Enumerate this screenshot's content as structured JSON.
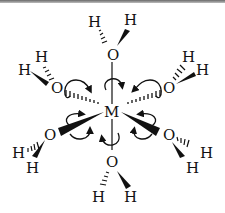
{
  "diagram": {
    "center": {
      "label": "M",
      "x": 112,
      "y": 112
    },
    "ligands": [
      {
        "id": "top",
        "O": "O",
        "H1": "H",
        "H2": "H",
        "ox": 113,
        "oy": 56
      },
      {
        "id": "upper-left",
        "O": "O",
        "H1": "H",
        "H2": "H",
        "ox": 57,
        "oy": 88
      },
      {
        "id": "upper-right",
        "O": "O",
        "H1": "H",
        "H2": "H",
        "ox": 170,
        "oy": 88
      },
      {
        "id": "lower-left",
        "O": "O",
        "H1": "H",
        "H2": "H",
        "ox": 50,
        "oy": 134
      },
      {
        "id": "lower-right",
        "O": "O",
        "H1": "H",
        "H2": "H",
        "ox": 168,
        "oy": 134
      },
      {
        "id": "bottom",
        "O": "O",
        "H1": "H",
        "H2": "H",
        "ox": 112,
        "oy": 160
      }
    ],
    "colors": {
      "ink": "#111111",
      "background": "#ffffff"
    }
  }
}
